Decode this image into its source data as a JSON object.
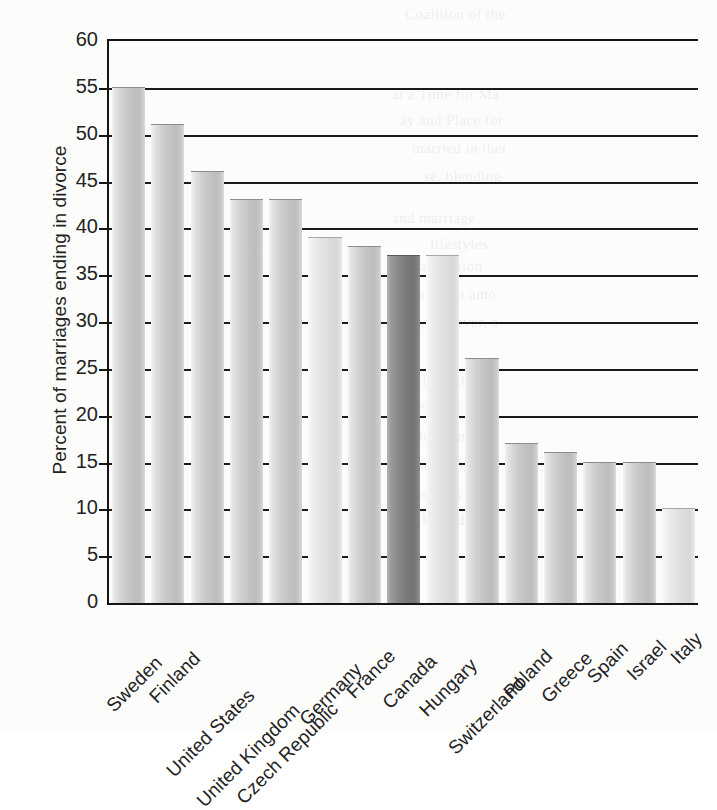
{
  "chart_data": {
    "type": "bar",
    "title": "",
    "subtitle": "",
    "xlabel": "",
    "ylabel": "Percent of marriages ending in divorce",
    "ylim": [
      0,
      60
    ],
    "ytick_step": 5,
    "yticks": [
      "0",
      "5",
      "10",
      "15",
      "20",
      "25",
      "30",
      "35",
      "40",
      "45",
      "50",
      "55",
      "60"
    ],
    "grid": true,
    "grid_axis": "y",
    "legend": "none",
    "categories": [
      "Sweden",
      "Finland",
      "United States",
      "United Kingdom",
      "Czech Republic",
      "Germany",
      "France",
      "Canada",
      "Hungary",
      "Switzerland",
      "Poland",
      "Greece",
      "Spain",
      "Israel",
      "Italy"
    ],
    "values": [
      55,
      51,
      46,
      43,
      43,
      39,
      38,
      37,
      37,
      26,
      17,
      16,
      15,
      15,
      10
    ],
    "highlight_category": "Canada",
    "bar_styles": [
      "default",
      "default",
      "default",
      "default",
      "default",
      "light",
      "default",
      "highlight",
      "light",
      "default",
      "default",
      "default",
      "default",
      "default",
      "light"
    ],
    "colors": {
      "axis": "#151515",
      "gridline": "#1b1b1b",
      "text": "#232323",
      "bar_light": "#e4e4e4",
      "bar_default": "#c2c2c2",
      "bar_highlight": "#787878",
      "background": "#fcfcfb"
    }
  },
  "ghost_text": [
    {
      "t": "Coalition of the",
      "x": 405,
      "y": 6
    },
    {
      "t": "at a Time for Ma",
      "x": 392,
      "y": 86
    },
    {
      "t": "ay and Place for",
      "x": 400,
      "y": 112
    },
    {
      "t": "married in thei",
      "x": 412,
      "y": 140
    },
    {
      "t": "se, blending",
      "x": 424,
      "y": 168
    },
    {
      "t": "Cohabitation",
      "x": 400,
      "y": 258
    },
    {
      "t": "g common amo",
      "x": 398,
      "y": 286
    },
    {
      "t": "is, however, a",
      "x": 410,
      "y": 314
    },
    {
      "t": "that impact mar",
      "x": 394,
      "y": 372
    },
    {
      "t": "1999), the cha",
      "x": 398,
      "y": 400
    },
    {
      "t": "ollow a more",
      "x": 406,
      "y": 428
    },
    {
      "t": "and marriage",
      "x": 392,
      "y": 210
    },
    {
      "t": "lifestyles",
      "x": 430,
      "y": 236
    },
    {
      "t": "a stronger",
      "x": 420,
      "y": 456
    },
    {
      "t": "Denmark",
      "x": 404,
      "y": 486
    },
    {
      "t": "the United",
      "x": 398,
      "y": 512
    }
  ]
}
